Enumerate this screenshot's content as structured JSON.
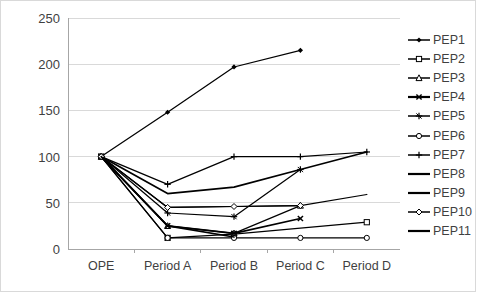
{
  "chart_data": {
    "type": "line",
    "title": "",
    "subtitle": "",
    "xlabel": "",
    "ylabel": "",
    "categories": [
      "OPE",
      "Period A",
      "Period B",
      "Period C",
      "Period D"
    ],
    "ylim": [
      0,
      250
    ],
    "yticks": [
      0,
      50,
      100,
      150,
      200,
      250
    ],
    "ytick_labels": [
      "0",
      "50",
      "100",
      "150",
      "200",
      "250"
    ],
    "grid": "horizontal",
    "legend_position": "right",
    "line_color": "#000000",
    "grid_color": "#d9d9d9",
    "text_color": "#3f3f3f",
    "series": [
      {
        "name": "PEP1",
        "marker": "diamond-filled",
        "values": [
          100,
          148,
          197,
          215,
          null
        ]
      },
      {
        "name": "PEP2",
        "marker": "square-open",
        "values": [
          100,
          12,
          16,
          null,
          29
        ]
      },
      {
        "name": "PEP3",
        "marker": "triangle-open",
        "values": [
          100,
          25,
          17,
          47,
          null
        ]
      },
      {
        "name": "PEP4",
        "marker": "cross-x",
        "values": [
          100,
          25,
          17,
          33,
          null
        ]
      },
      {
        "name": "PEP5",
        "marker": "star-line",
        "values": [
          100,
          39,
          35,
          86,
          null
        ]
      },
      {
        "name": "PEP6",
        "marker": "circle-open",
        "values": [
          100,
          12,
          12,
          12,
          12
        ]
      },
      {
        "name": "PEP7",
        "marker": "plus",
        "values": [
          100,
          70,
          100,
          100,
          105
        ]
      },
      {
        "name": "PEP8",
        "marker": "none",
        "values": [
          100,
          60,
          67,
          86,
          105
        ]
      },
      {
        "name": "PEP9",
        "marker": "none",
        "values": [
          100,
          45,
          46,
          47,
          59
        ]
      },
      {
        "name": "PEP10",
        "marker": "diamond-open",
        "values": [
          100,
          45,
          46,
          47,
          null
        ]
      },
      {
        "name": "PEP11",
        "marker": "none",
        "values": [
          100,
          25,
          13,
          null,
          null
        ]
      }
    ]
  },
  "legend": {
    "items": [
      {
        "label": "PEP1"
      },
      {
        "label": "PEP2"
      },
      {
        "label": "PEP3"
      },
      {
        "label": "PEP4"
      },
      {
        "label": "PEP5"
      },
      {
        "label": "PEP6"
      },
      {
        "label": "PEP7"
      },
      {
        "label": "PEP8"
      },
      {
        "label": "PEP9"
      },
      {
        "label": "PEP10"
      },
      {
        "label": "PEP11"
      }
    ]
  }
}
